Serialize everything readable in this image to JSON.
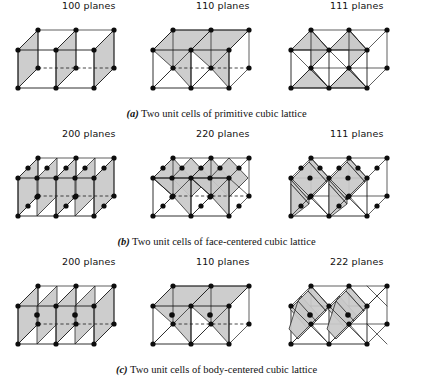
{
  "figure": {
    "background_color": "#ffffff",
    "line_color": "#1a1a1a",
    "plane_fill_color": "#c9c9c9",
    "atom_color": "#0d0d0d"
  },
  "rows": [
    {
      "id": "a",
      "label": "(a)",
      "caption": "Two unit cells of primitive cubic lattice",
      "lattice_type": "primitive cubic",
      "cells": [
        {
          "header": "100 planes",
          "miller_index": "100",
          "plane_count": 3
        },
        {
          "header": "110 planes",
          "miller_index": "110",
          "plane_count": 2
        },
        {
          "header": "111 planes",
          "miller_index": "111",
          "plane_count": 4
        }
      ]
    },
    {
      "id": "b",
      "label": "(b)",
      "caption": "Two unit cells of face-centered cubic lattice",
      "lattice_type": "face-centered cubic",
      "cells": [
        {
          "header": "200 planes",
          "miller_index": "200",
          "plane_count": 5
        },
        {
          "header": "220 planes",
          "miller_index": "220",
          "plane_count": 4
        },
        {
          "header": "111 planes",
          "miller_index": "111",
          "plane_count": 4
        }
      ]
    },
    {
      "id": "c",
      "label": "(c)",
      "caption": "Two unit cells of body-centered cubic lattice",
      "lattice_type": "body-centered cubic",
      "cells": [
        {
          "header": "200 planes",
          "miller_index": "200",
          "plane_count": 5
        },
        {
          "header": "110 planes",
          "miller_index": "110",
          "plane_count": 2
        },
        {
          "header": "222 planes",
          "miller_index": "222",
          "plane_count": 6
        }
      ]
    }
  ],
  "geometry": {
    "cube_size": 38,
    "depth_dx": 20,
    "depth_dy": -20,
    "cells_per_figure": 2,
    "atom_radius": 2.6
  }
}
